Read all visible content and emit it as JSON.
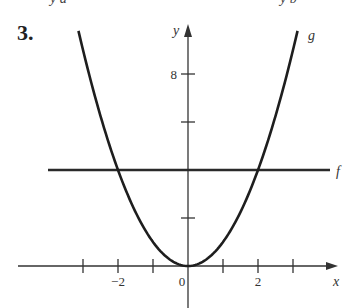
{
  "problem": {
    "number": "3."
  },
  "top_fragments": {
    "left": "y a",
    "right": "y b"
  },
  "chart_data": {
    "type": "line",
    "title": "",
    "xlabel": "x",
    "ylabel": "y",
    "xlim": [
      -3.5,
      4.2
    ],
    "ylim": [
      0,
      10
    ],
    "grid": false,
    "x_ticks": [
      -3,
      -2,
      -1,
      0,
      1,
      2,
      3
    ],
    "x_tick_labels": [
      {
        "value": -2,
        "label": "−2"
      },
      {
        "value": 0,
        "label": "0"
      },
      {
        "value": 2,
        "label": "2"
      }
    ],
    "y_ticks": [
      2,
      4,
      6,
      8
    ],
    "y_tick_labels": [
      {
        "value": 8,
        "label": "8"
      }
    ],
    "series": [
      {
        "name": "g",
        "label": "g",
        "expression": "y = x^2",
        "x": [
          -3.1,
          -2,
          -1,
          0,
          1,
          2,
          3.1
        ],
        "values": [
          9.61,
          4,
          1,
          0,
          1,
          4,
          9.61
        ]
      },
      {
        "name": "f",
        "label": "f",
        "expression": "y = 4",
        "x": [
          -4,
          4.1
        ],
        "values": [
          4,
          4
        ]
      }
    ],
    "intersections": [
      [
        -2,
        4
      ],
      [
        2,
        4
      ]
    ]
  }
}
